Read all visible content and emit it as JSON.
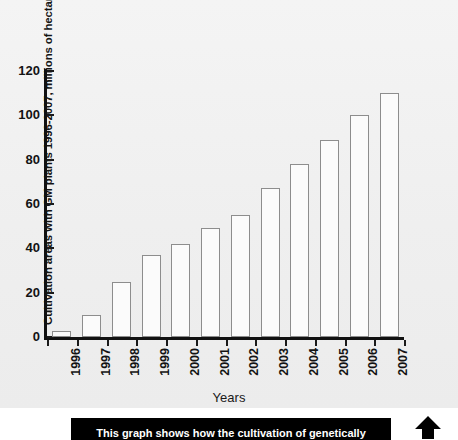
{
  "chart_data": {
    "type": "bar",
    "title": "",
    "xlabel": "Years",
    "ylabel": "Cultivation areas with GM plants 1996-2007, millions of hectares",
    "categories": [
      "1996",
      "1997",
      "1998",
      "1999",
      "2000",
      "2001",
      "2002",
      "2003",
      "2004",
      "2005",
      "2006",
      "2007"
    ],
    "values": [
      2.8,
      10,
      25,
      37,
      42,
      49,
      55,
      67,
      78,
      89,
      100,
      110
    ],
    "ylim": [
      0,
      120
    ],
    "yticks": [
      0,
      20,
      40,
      60,
      80,
      100,
      120
    ],
    "ytick_labels": [
      "0",
      "20",
      "40",
      "60",
      "80",
      "100",
      "120"
    ],
    "grid": false,
    "legend": null,
    "bar_fill": "#fbfbfb",
    "bar_stroke": "#8d8d8d",
    "axis_color": "#111111",
    "plot_background": "#f1f1f1"
  },
  "caption": {
    "text": "This graph shows how the cultivation of genetically",
    "background": "#000000",
    "color": "#ffffff"
  },
  "arrow": {
    "name": "up-arrow-icon",
    "color": "#000000"
  }
}
